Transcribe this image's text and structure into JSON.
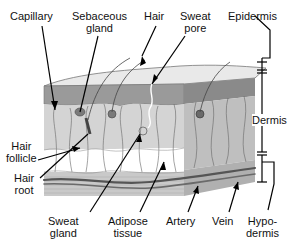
{
  "diagram": {
    "colors": {
      "epidermis_top": "#e6e6e6",
      "epidermis_dark": "#8f8f8f",
      "dermis": "#d2d2d2",
      "dermis_side": "#bdbdbd",
      "adipose": "#ffffff",
      "hypodermis": "#c8c8c8",
      "vessel": "#555555",
      "line": "#000000"
    },
    "labels": {
      "capillary": [
        "Capillary"
      ],
      "sebaceous_gland": [
        "Sebaceous",
        "gland"
      ],
      "hair": [
        "Hair"
      ],
      "sweat_pore": [
        "Sweat",
        "pore"
      ],
      "epidermis": [
        "Epidermis"
      ],
      "dermis": [
        "Dermis"
      ],
      "hair_follicle": [
        "Hair",
        "follicle"
      ],
      "hair_root": [
        "Hair",
        "root"
      ],
      "sweat_gland": [
        "Sweat",
        "gland"
      ],
      "adipose_tissue": [
        "Adipose",
        "tissue"
      ],
      "artery": [
        "Artery"
      ],
      "vein": [
        "Vein"
      ],
      "hypodermis": [
        "Hypo-",
        "dermis"
      ]
    }
  }
}
